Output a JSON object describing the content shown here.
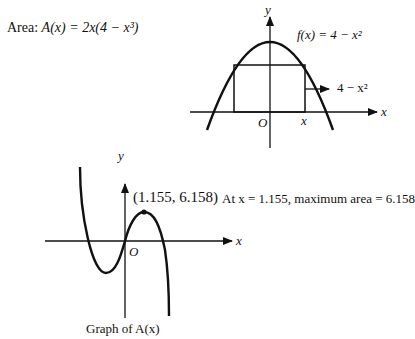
{
  "area_formula": {
    "prefix": "Area: ",
    "text": "A(x) = 2x(4 − x³)"
  },
  "top_graph": {
    "function_label": "f(x) = 4 − x²",
    "height_label": "4 − x²",
    "x_axis_label": "x",
    "y_axis_label": "y",
    "origin_label": "O",
    "x_tick_label": "x"
  },
  "bottom_graph": {
    "point_label": "(1.155, 6.158)",
    "x_axis_label": "x",
    "y_axis_label": "y",
    "origin_label": "O",
    "caption": "Graph of A(x)"
  },
  "conclusion": "At x = 1.155, maximum area = 6.158",
  "colors": {
    "ink": "#111111",
    "background": "#ffffff"
  }
}
